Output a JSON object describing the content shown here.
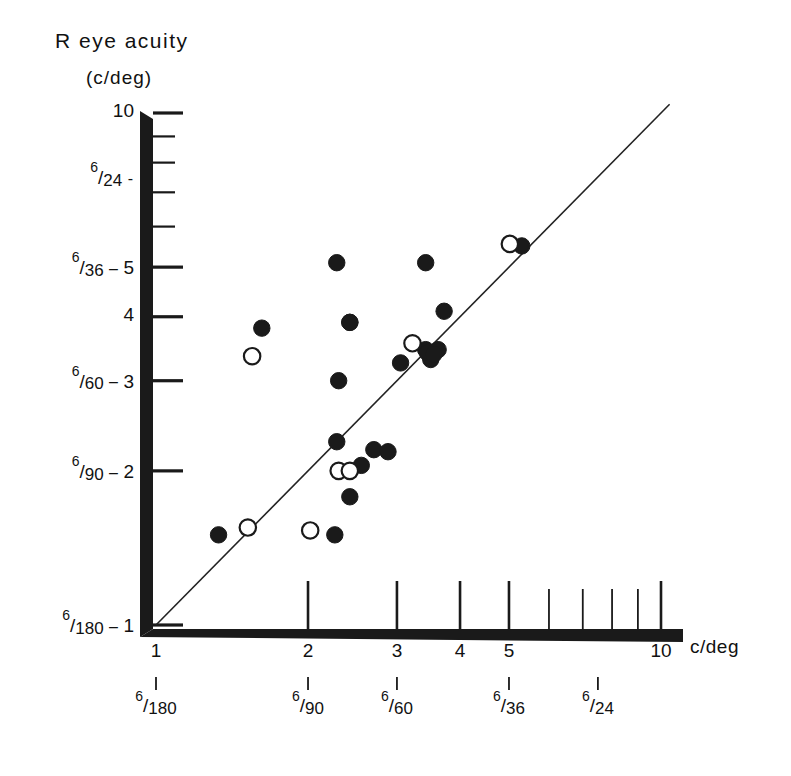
{
  "figure": {
    "y_axis_title": "R eye acuity",
    "y_axis_unit": "(c/deg)",
    "x_axis_unit": "c/deg"
  },
  "chart_data": {
    "type": "scatter",
    "xlabel": "c/deg",
    "ylabel": "R eye acuity (c/deg)",
    "xscale": "log",
    "yscale": "log",
    "xlim": [
      1,
      10
    ],
    "ylim": [
      1,
      10
    ],
    "grid": false,
    "legend": "none",
    "x_tick_values": [
      1,
      2,
      3,
      4,
      5,
      6,
      7,
      8,
      9,
      10
    ],
    "x_tick_labels": [
      "1",
      "2",
      "3",
      "4",
      "5",
      "",
      "",
      "",
      "",
      "10"
    ],
    "y_tick_values": [
      1,
      2,
      3,
      4,
      5,
      6,
      7,
      8,
      9,
      10
    ],
    "y_tick_labels": [
      "1",
      "2",
      "3",
      "4",
      "5",
      "",
      "",
      "",
      "",
      "10"
    ],
    "y_snellen_labels": [
      {
        "value": 1,
        "numerator": "6",
        "denominator": "180",
        "cyc": "1"
      },
      {
        "value": 2,
        "numerator": "6",
        "denominator": "90",
        "cyc": "2"
      },
      {
        "value": 3,
        "numerator": "6",
        "denominator": "60",
        "cyc": "3"
      },
      {
        "value": 4,
        "numerator": "",
        "denominator": "",
        "cyc": "4"
      },
      {
        "value": 5,
        "numerator": "6",
        "denominator": "36",
        "cyc": "5"
      },
      {
        "value": 7.5,
        "numerator": "6",
        "denominator": "24",
        "cyc": ""
      },
      {
        "value": 10,
        "numerator": "",
        "denominator": "",
        "cyc": "10"
      }
    ],
    "x_snellen_labels": [
      {
        "value": 1,
        "numerator": "6",
        "denominator": "180"
      },
      {
        "value": 2,
        "numerator": "6",
        "denominator": "90"
      },
      {
        "value": 3,
        "numerator": "6",
        "denominator": "60"
      },
      {
        "value": 5,
        "numerator": "6",
        "denominator": "36"
      },
      {
        "value": 7.5,
        "numerator": "6",
        "denominator": "24"
      }
    ],
    "reference_line": {
      "name": "unity-line",
      "from": [
        1,
        1
      ],
      "to": [
        10.4,
        10.4
      ],
      "description": "line of equality (y = x)"
    },
    "series": [
      {
        "name": "filled",
        "marker": "filled-circle",
        "color": "#1a1a1a",
        "count": 21,
        "points": [
          [
            1.33,
            1.5
          ],
          [
            2.26,
            1.5
          ],
          [
            2.42,
            1.78
          ],
          [
            2.28,
            2.28
          ],
          [
            2.55,
            2.05
          ],
          [
            2.7,
            2.2
          ],
          [
            2.88,
            2.18
          ],
          [
            2.3,
            3.0
          ],
          [
            1.62,
            3.8
          ],
          [
            2.42,
            3.9
          ],
          [
            3.05,
            3.25
          ],
          [
            3.42,
            3.45
          ],
          [
            3.5,
            3.3
          ],
          [
            3.62,
            3.45
          ],
          [
            3.72,
            4.1
          ],
          [
            2.28,
            5.1
          ],
          [
            3.42,
            5.1
          ],
          [
            5.3,
            5.5
          ],
          [
            2.42,
            3.9
          ],
          [
            3.45,
            3.4
          ],
          [
            3.55,
            3.38
          ]
        ]
      },
      {
        "name": "open",
        "marker": "open-circle",
        "color": "#1a1a1a",
        "count": 7,
        "points": [
          [
            1.52,
            1.55
          ],
          [
            2.02,
            1.53
          ],
          [
            2.3,
            2.0
          ],
          [
            2.42,
            2.0
          ],
          [
            1.55,
            3.35
          ],
          [
            3.22,
            3.55
          ],
          [
            5.02,
            5.55
          ]
        ]
      }
    ]
  }
}
